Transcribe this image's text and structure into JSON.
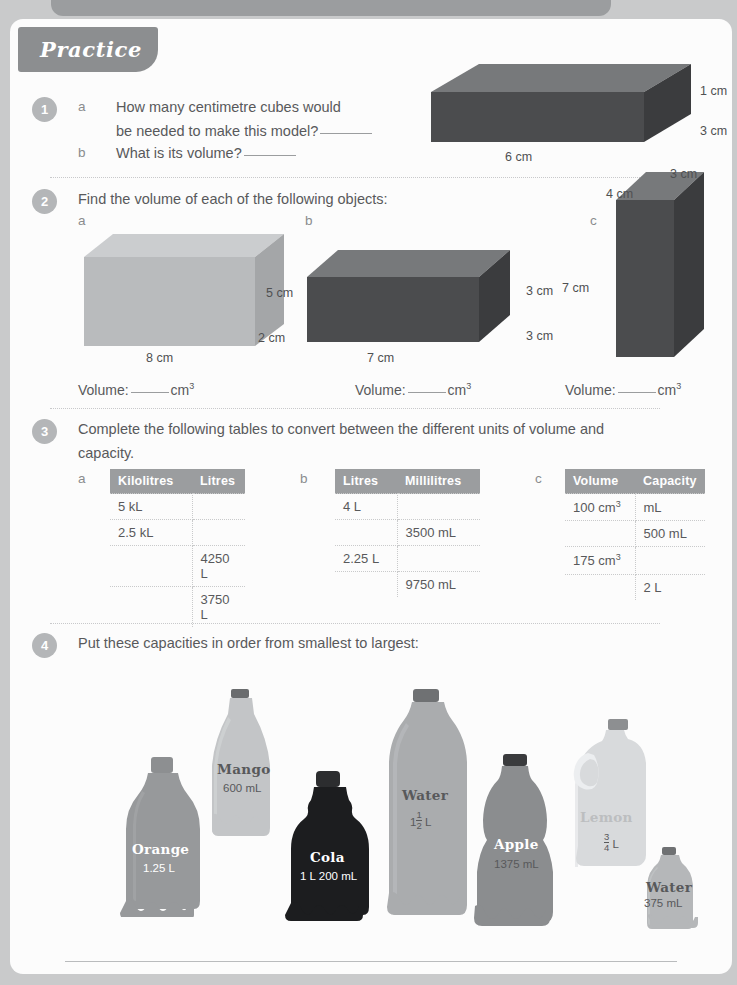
{
  "heading": {
    "label": "Practice"
  },
  "questions": {
    "q1": {
      "number": "1",
      "parts": [
        {
          "letter": "a",
          "text_line1": "How many centimetre cubes would",
          "text_line2": "be needed to make this model?"
        },
        {
          "letter": "b",
          "text_line1": "What is its volume?"
        }
      ],
      "diagram": {
        "width": "6 cm",
        "depth": "3 cm",
        "height": "1 cm"
      }
    },
    "q2": {
      "number": "2",
      "prompt": "Find the volume of each of the following objects:",
      "objects": [
        {
          "letter": "a",
          "length": "8 cm",
          "height": "5 cm",
          "depth": "2 cm",
          "answer_label": "Volume:",
          "unit": "cm",
          "unit_sup": "3"
        },
        {
          "letter": "b",
          "length": "7 cm",
          "height": "3 cm",
          "depth": "3 cm",
          "answer_label": "Volume:",
          "unit": "cm",
          "unit_sup": "3"
        },
        {
          "letter": "c",
          "length": "3 cm",
          "height": "7 cm",
          "depth": "4 cm",
          "answer_label": "Volume:",
          "unit": "cm",
          "unit_sup": "3"
        }
      ]
    },
    "q3": {
      "number": "3",
      "prompt_line1": "Complete the following tables to convert between the different units of volume and",
      "prompt_line2": "capacity.",
      "tables": [
        {
          "letter": "a",
          "headers": [
            "Kilolitres",
            "Litres"
          ],
          "rows": [
            [
              "5 kL",
              ""
            ],
            [
              "2.5 kL",
              ""
            ],
            [
              "",
              "4250 L"
            ],
            [
              "",
              "3750 L"
            ]
          ]
        },
        {
          "letter": "b",
          "headers": [
            "Litres",
            "Millilitres"
          ],
          "rows": [
            [
              "4 L",
              ""
            ],
            [
              "",
              "3500 mL"
            ],
            [
              "2.25 L",
              ""
            ],
            [
              "",
              "9750 mL"
            ]
          ]
        },
        {
          "letter": "c",
          "headers": [
            "Volume",
            "Capacity"
          ],
          "rows": [
            [
              "100 cm3",
              "mL"
            ],
            [
              "",
              "500 mL"
            ],
            [
              "175 cm3",
              ""
            ],
            [
              "",
              "2 L"
            ]
          ]
        }
      ]
    },
    "q4": {
      "number": "4",
      "prompt": "Put these capacities in order from smallest to largest:",
      "bottles": [
        {
          "name": "Orange",
          "capacity": "1.25 L"
        },
        {
          "name": "Mango",
          "capacity": "600 mL"
        },
        {
          "name": "Cola",
          "capacity": "1 L 200 mL"
        },
        {
          "name": "Water",
          "capacity_whole": "1",
          "capacity_num": "1",
          "capacity_den": "2",
          "capacity_unit": "L"
        },
        {
          "name": "Apple",
          "capacity": "1375 mL"
        },
        {
          "name": "Lemon",
          "capacity_whole": "",
          "capacity_num": "3",
          "capacity_den": "4",
          "capacity_unit": "L"
        },
        {
          "name": "Water",
          "capacity": "375 mL"
        }
      ]
    }
  },
  "colors": {
    "page_bg": "#fcfcfc",
    "outer_bg": "#c9cacb",
    "heading_tab": "#8c8e90",
    "qnum_circle": "#b4b6b8",
    "table_header": "#9b9d9f",
    "body_text": "#58595b",
    "box_dark_front": "#4b4c4e",
    "box_dark_top": "#77797b",
    "box_light_front": "#b9bbbd",
    "box_light_top": "#cbcdcf"
  }
}
